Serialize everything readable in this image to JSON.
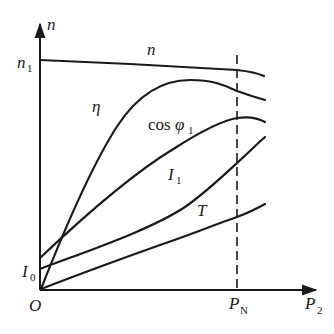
{
  "diagram": {
    "title": "",
    "type": "motor operating characteristics",
    "axes": {
      "y_axis_label": "n",
      "x_axis_label_main": "P",
      "x_axis_label_sub": "2",
      "origin_label": "O"
    },
    "y_ticks": [
      {
        "main": "n",
        "sub": "1"
      },
      {
        "main": "I",
        "sub": "0"
      }
    ],
    "x_ticks": [
      {
        "main": "P",
        "sub": "N"
      }
    ],
    "curves": [
      {
        "id": "n",
        "label_main": "n",
        "label_sub": ""
      },
      {
        "id": "eta",
        "label_main": "η",
        "label_sub": ""
      },
      {
        "id": "cosphi",
        "label_main": "cos φ",
        "label_sub": "1"
      },
      {
        "id": "i1",
        "label_main": "I",
        "label_sub": "1"
      },
      {
        "id": "t",
        "label_main": "T",
        "label_sub": ""
      }
    ],
    "rated_line_label": "P_N"
  }
}
